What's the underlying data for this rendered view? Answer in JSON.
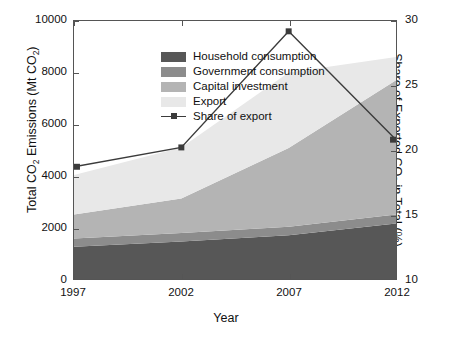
{
  "chart_data": {
    "type": "area",
    "title": "",
    "xlabel": "Year",
    "ylabel": "Total CO 2  Emissions (Mt CO 2 )",
    "ylabel_parts": {
      "a": "Total CO",
      "b": "2",
      "c": " Emissions (Mt CO",
      "d": "2",
      "e": ")"
    },
    "y2label_parts": {
      "a": "Share of Exported CO",
      "b": "2",
      "c": " in Total (%)"
    },
    "categories": [
      "1997",
      "2002",
      "2007",
      "2012"
    ],
    "x": [
      1997,
      2002,
      2007,
      2012
    ],
    "ylim": [
      0,
      10000
    ],
    "yticks": [
      "0",
      "2000",
      "4000",
      "6000",
      "8000",
      "10000"
    ],
    "ytick_values": [
      0,
      2000,
      4000,
      6000,
      8000,
      10000
    ],
    "y2lim": [
      10,
      30
    ],
    "y2ticks": [
      "10",
      "15",
      "20",
      "25",
      "30"
    ],
    "y2tick_values": [
      10,
      15,
      20,
      25,
      30
    ],
    "grid": false,
    "legend_position": "upper-left-inside",
    "stacked": true,
    "series": [
      {
        "name": "Household consumption",
        "color": "#575757",
        "values": [
          1250,
          1450,
          1700,
          2150
        ]
      },
      {
        "name": "Government consumption",
        "color": "#8c8c8c",
        "values": [
          320,
          330,
          330,
          350
        ]
      },
      {
        "name": "Capital investment",
        "color": "#b4b4b4",
        "values": [
          930,
          1340,
          3050,
          5200
        ]
      },
      {
        "name": "Export",
        "color": "#e8e8e8",
        "values": [
          1530,
          1980,
          2920,
          900
        ]
      }
    ],
    "line_series": {
      "name": "Share of export",
      "color": "#3b3b3b",
      "marker": "square",
      "axis": "right",
      "values": [
        18.7,
        20.2,
        29.2,
        20.8
      ]
    }
  },
  "legend": {
    "items": [
      {
        "label": "Household consumption",
        "color": "#575757",
        "type": "swatch"
      },
      {
        "label": "Government consumption",
        "color": "#8c8c8c",
        "type": "swatch"
      },
      {
        "label": "Capital investment",
        "color": "#b4b4b4",
        "type": "swatch"
      },
      {
        "label": "Export",
        "color": "#e8e8e8",
        "type": "swatch"
      },
      {
        "label": "Share of export",
        "color": "#3b3b3b",
        "type": "line-marker"
      }
    ]
  }
}
